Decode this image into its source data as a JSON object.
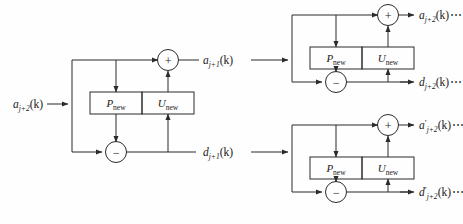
{
  "figure": {
    "type": "block-diagram",
    "background": "#fefefe",
    "stroke": "#2b2b2b"
  },
  "blocks": {
    "predict_label_main": "P",
    "predict_label_sub": "new",
    "update_label_main": "U",
    "update_label_sub": "new"
  },
  "operators": {
    "sum": "+",
    "difference": "−"
  },
  "stages": [
    {
      "id": "stage-left",
      "name": "lifting-stage-left",
      "input": {
        "main": "a",
        "sub": "j+2",
        "arg": "(k)",
        "prime": ""
      },
      "output_top": {
        "main": "a",
        "sub": "j+1",
        "arg": "(k)",
        "prime": "",
        "trail": ""
      },
      "output_bottom": {
        "main": "d",
        "sub": "j+1",
        "arg": "(k)",
        "prime": "",
        "trail": ""
      }
    },
    {
      "id": "stage-top-right",
      "name": "lifting-stage-top-right",
      "input": {
        "main": "a",
        "sub": "j+1",
        "arg": "(k)",
        "prime": ""
      },
      "output_top": {
        "main": "a",
        "sub": "j+2",
        "arg": "(k)",
        "prime": "",
        "trail": "⋯"
      },
      "output_bottom": {
        "main": "d",
        "sub": "j+2",
        "arg": "(k)",
        "prime": "",
        "trail": "⋯"
      }
    },
    {
      "id": "stage-bottom-right",
      "name": "lifting-stage-bottom-right",
      "input": {
        "main": "d",
        "sub": "j+1",
        "arg": "(k)",
        "prime": ""
      },
      "output_top": {
        "main": "a",
        "sub": "j+2",
        "arg": "(k)",
        "prime": "′",
        "trail": "⋯"
      },
      "output_bottom": {
        "main": "d",
        "sub": "j+2",
        "arg": "(k)",
        "prime": "′",
        "trail": "⋯"
      }
    }
  ],
  "labels": {
    "input_left": "a",
    "input_left_sub": "j+2",
    "input_left_arg": "(k)",
    "mid_top": "a",
    "mid_top_sub": "j+1",
    "mid_top_arg": "(k)",
    "mid_bottom": "d",
    "mid_bottom_sub": "j+1",
    "mid_bottom_arg": "(k)",
    "out_tr_top": "a",
    "out_tr_top_sub": "j+2",
    "out_tr_top_arg": "(k)",
    "out_tr_top_trail": "⋯",
    "out_tr_bottom": "d",
    "out_tr_bottom_sub": "j+2",
    "out_tr_bottom_arg": "(k)",
    "out_tr_bottom_trail": "⋯",
    "out_br_top": "a",
    "out_br_top_prime": "′",
    "out_br_top_sub": "j+2",
    "out_br_top_arg": "(k)",
    "out_br_top_trail": "⋯",
    "out_br_bottom": "d",
    "out_br_bottom_prime": "′",
    "out_br_bottom_sub": "j+2",
    "out_br_bottom_arg": "(k)",
    "out_br_bottom_trail": "⋯",
    "p_main_1": "P",
    "p_sub_1": "new",
    "u_main_1": "U",
    "u_sub_1": "new",
    "p_main_2": "P",
    "p_sub_2": "new",
    "u_main_2": "U",
    "u_sub_2": "new",
    "p_main_3": "P",
    "p_sub_3": "new",
    "u_main_3": "U",
    "u_sub_3": "new",
    "plus_1": "+",
    "minus_1": "−",
    "plus_2": "+",
    "minus_2": "−",
    "plus_3": "+",
    "minus_3": "−"
  }
}
